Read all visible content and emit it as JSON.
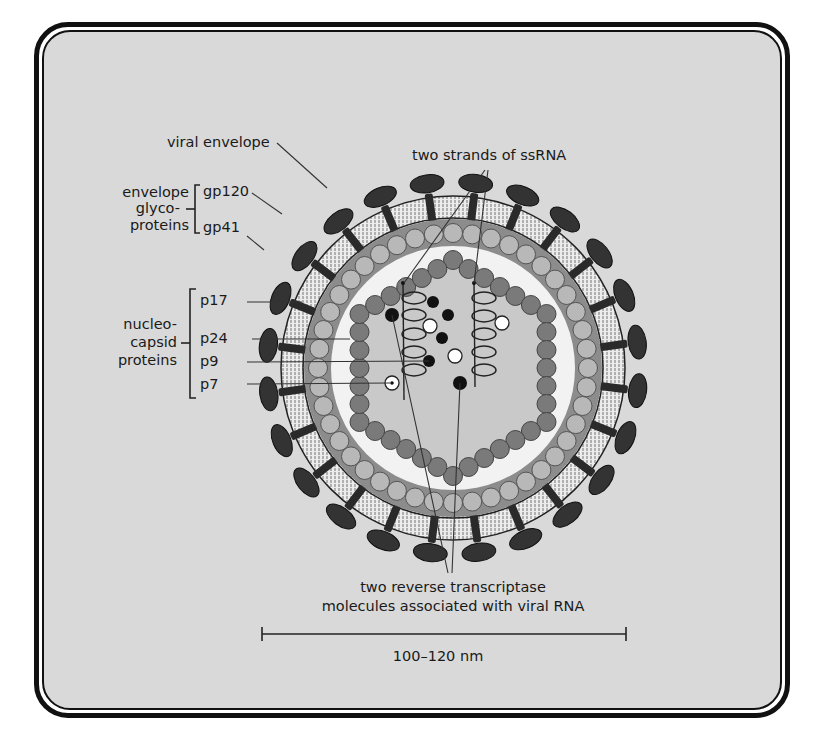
{
  "figure": {
    "labels": {
      "ssrna": "two strands of ssRNA",
      "viral_envelope": "viral envelope",
      "envelope_glyco_group": [
        "envelope",
        "glyco-",
        "proteins"
      ],
      "gp120": "gp120",
      "gp41": "gp41",
      "nucleocapsid_group": [
        "nucleo-",
        "capsid",
        "proteins"
      ],
      "p17": "p17",
      "p24": "p24",
      "p9": "p9",
      "p7": "p7",
      "reverse_transcriptase": [
        "two reverse transcriptase",
        "molecules associated with viral RNA"
      ]
    },
    "scale_bar": {
      "label": "100–120 nm"
    },
    "colors": {
      "background": "#d9d9d9",
      "frame": "#111111",
      "spike": "#333333",
      "membrane": "#e8e8e8",
      "matrix": "#8c8c8c",
      "matrix_bead": "#b8b8b8",
      "capsid_fill": "#c9c9c9",
      "capsid_bead": "#7a7a7a",
      "core_interior": "#f2f2f2"
    }
  }
}
